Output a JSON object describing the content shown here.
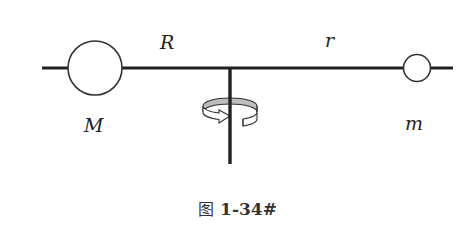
{
  "diagram": {
    "labels": {
      "big_mass": "M",
      "small_mass": "m",
      "big_radius": "R",
      "small_radius": "r"
    },
    "colors": {
      "stroke": "#222222",
      "band_fill": "#bdbdbd",
      "background": "#ffffff"
    }
  },
  "caption": {
    "prefix": "图",
    "number": "1-34#"
  }
}
